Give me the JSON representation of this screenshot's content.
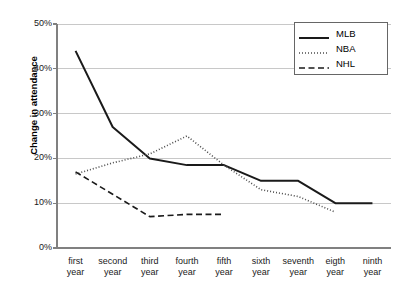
{
  "chart_data": {
    "type": "line",
    "title": "",
    "xlabel": "",
    "ylabel": "Change in attendance",
    "ylim": [
      0,
      50
    ],
    "ytick_labels": [
      "50%",
      "40%",
      "30%",
      "20%",
      "10%",
      "0%"
    ],
    "ytick_values": [
      50,
      40,
      30,
      20,
      10,
      0
    ],
    "grid": true,
    "legend_position": "top-right",
    "categories": [
      "first year",
      "second year",
      "third year",
      "fourth year",
      "fifth year",
      "sixth year",
      "seventh year",
      "eigth year",
      "ninth year"
    ],
    "category_lines": [
      [
        "first",
        "year"
      ],
      [
        "second",
        "year"
      ],
      [
        "third",
        "year"
      ],
      [
        "fourth",
        "year"
      ],
      [
        "fifth",
        "year"
      ],
      [
        "sixth",
        "year"
      ],
      [
        "seventh",
        "year"
      ],
      [
        "eigth",
        "year"
      ],
      [
        "ninth",
        "year"
      ]
    ],
    "series": [
      {
        "name": "MLB",
        "style": "solid",
        "color": "#1a1a1a",
        "values": [
          44,
          27,
          20,
          18.5,
          18.5,
          15,
          15,
          10,
          10
        ]
      },
      {
        "name": "NBA",
        "style": "dotted",
        "color": "#4d4d4d",
        "values": [
          16.5,
          19,
          21,
          25,
          18.5,
          13,
          11.5,
          8,
          null
        ]
      },
      {
        "name": "NHL",
        "style": "dashed",
        "color": "#1a1a1a",
        "values": [
          17,
          12,
          7,
          7.5,
          7.5,
          null,
          null,
          null,
          null
        ]
      }
    ]
  },
  "legend": {
    "entries": [
      {
        "label": "MLB"
      },
      {
        "label": "NBA"
      },
      {
        "label": "NHL"
      }
    ]
  },
  "colors": {
    "gridline": "#c8c8c8",
    "axis": "#808080",
    "background": "#ffffff"
  }
}
